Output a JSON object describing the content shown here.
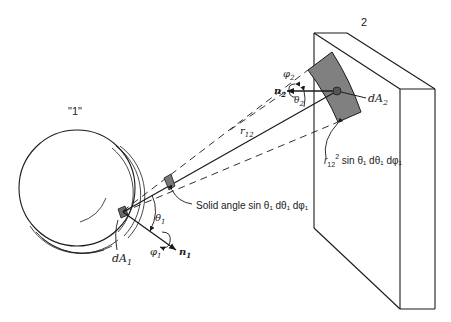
{
  "diagram": {
    "surface1_label": "\"1\"",
    "surface2_label": "2",
    "dA1": "dA",
    "dA1_sub": "1",
    "dA2": "dA",
    "dA2_sub": "2",
    "n1": "n",
    "n1_sub": "1",
    "n2": "n",
    "n2_sub": "2",
    "theta1": "θ",
    "theta1_sub": "1",
    "theta2": "θ",
    "theta2_sub": "2",
    "phi1": "φ",
    "phi1_sub": "1",
    "phi2": "φ",
    "phi2_sub": "2",
    "r12": "r",
    "r12_sub": "12",
    "solid_angle_label": "Solid angle sin θ₁ dθ₁ dφ₁",
    "projected_area_prefix": "r",
    "projected_area_sub": "12",
    "projected_area_sup": "2",
    "projected_area_rest": " sin θ₁ dθ₁ dφ₁"
  },
  "colors": {
    "line": "#1a1a1a",
    "shade": "#7a7a7a"
  }
}
